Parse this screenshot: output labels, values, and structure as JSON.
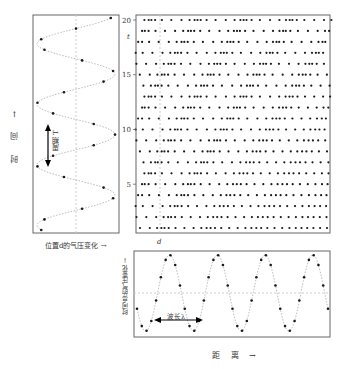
{
  "labels": {
    "time_axis": "时  间 →",
    "period": "周期 T",
    "left_xlabel": "位置d的气压变化 →",
    "t_marker": "t",
    "d_marker": "d",
    "bottom_ylabel": "时间点t的气压变化 →",
    "wavelength": "波长λ",
    "distance": "距  离 →"
  },
  "chart_data": [
    {
      "type": "line",
      "name": "pressure-vs-time-at-position-d",
      "xlabel": "位置d的气压变化 →",
      "ylabel": "时 间 →",
      "ylim": [
        0,
        20
      ],
      "cycles": 3.5,
      "annotation": "周期 T",
      "grid": false
    },
    {
      "type": "scatter",
      "name": "air-molecule-density",
      "ylabel": "time",
      "yticks": [
        5,
        10,
        15,
        20
      ],
      "ylim": [
        0,
        20
      ],
      "rows": 20,
      "markers": {
        "t": 17,
        "d": 0.08
      },
      "description": "molecule positions; compressions drift rightward over time"
    },
    {
      "type": "line",
      "name": "pressure-vs-distance-at-time-t",
      "xlabel": "距 离 →",
      "ylabel": "时间点t的气压变化 →",
      "cycles": 4,
      "annotation": "波长λ",
      "grid": false
    }
  ],
  "colors": {
    "frame": "#666666",
    "dot": "#1a1a1a",
    "curve": "#aaaaaa",
    "axisline": "#bbbbbb"
  }
}
